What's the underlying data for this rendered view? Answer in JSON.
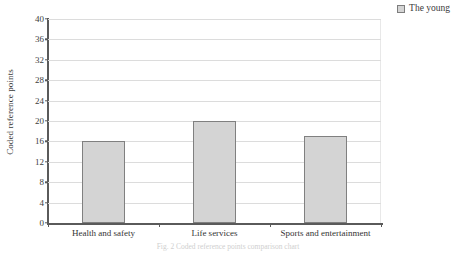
{
  "chart_data": {
    "type": "bar",
    "title": "",
    "xlabel": "",
    "ylabel": "Coded reference points",
    "categories": [
      "Health and safety",
      "Life services",
      "Sports and entertainment"
    ],
    "series": [
      {
        "name": "The young",
        "values": [
          16,
          20,
          17
        ]
      }
    ],
    "values": [
      16,
      20,
      17
    ],
    "ylim": [
      0,
      40
    ],
    "ytick_step": 4,
    "yticks": [
      0,
      4,
      8,
      12,
      16,
      20,
      24,
      28,
      32,
      36,
      40
    ],
    "grid": "horizontal",
    "legend_position": "top-right",
    "bar_fill_color": "#d4d4d4",
    "bar_border_color": "#808080",
    "axis_color": "#5a5a5a",
    "gridline_color": "#dcdcdc"
  },
  "legend": {
    "entries": [
      {
        "label": "The young",
        "color": "#d4d4d4"
      }
    ]
  },
  "caption": {
    "text": "Fig. 2  Coded reference points comparison chart"
  }
}
